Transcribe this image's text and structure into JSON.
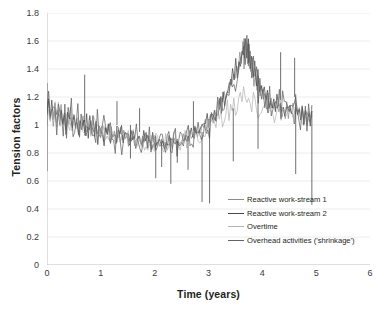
{
  "chart_data": {
    "type": "line",
    "title": "",
    "xlabel": "Time (years)",
    "ylabel": "Tension factors",
    "xlim": [
      0,
      6
    ],
    "ylim": [
      0,
      1.8
    ],
    "xticks": [
      "0",
      "1",
      "2",
      "3",
      "4",
      "5",
      "6"
    ],
    "yticks": [
      "0",
      "0.2",
      "0.4",
      "0.6",
      "0.8",
      "1",
      "1.2",
      "1.4",
      "1.6",
      "1.8"
    ],
    "grid": "horizontal",
    "legend_position": "inside-lower-right",
    "x_data_start": 0.0,
    "x_data_end": 4.92,
    "series": [
      {
        "name": "Reactive work-stream 1",
        "color": "#8c8c8c",
        "values": [
          1.07,
          1.18,
          1.05,
          1.14,
          1.02,
          1.12,
          1.0,
          1.1,
          1.04,
          1.13,
          1.01,
          1.09,
          0.99,
          1.08,
          1.03,
          1.11,
          0.98,
          1.06,
          1.0,
          1.07,
          0.95,
          1.05,
          0.99,
          1.04,
          0.94,
          1.02,
          0.97,
          1.03,
          0.93,
          1.0,
          0.96,
          1.01,
          0.92,
          0.99,
          0.95,
          1.0,
          0.91,
          0.97,
          0.94,
          0.99,
          0.9,
          0.96,
          0.93,
          0.98,
          0.89,
          0.95,
          0.92,
          0.96,
          0.88,
          0.94,
          0.91,
          0.95,
          0.87,
          0.93,
          0.9,
          0.94,
          0.87,
          0.92,
          0.89,
          0.93,
          0.86,
          0.91,
          0.88,
          0.92,
          0.86,
          0.9,
          0.88,
          0.91,
          0.85,
          0.9,
          0.87,
          0.91,
          0.85,
          0.89,
          0.87,
          0.9,
          0.85,
          0.89,
          0.86,
          0.9,
          0.85,
          0.89,
          0.87,
          0.91,
          0.86,
          0.9,
          0.88,
          0.92,
          0.87,
          0.92,
          0.89,
          0.94,
          0.9,
          0.95,
          0.92,
          0.97,
          0.93,
          0.99,
          0.95,
          1.0,
          0.97,
          1.02,
          0.99,
          1.05,
          1.01,
          1.07,
          1.04,
          1.1,
          1.07,
          1.14,
          1.1,
          1.18,
          1.14,
          1.22,
          1.18,
          1.27,
          1.22,
          1.32,
          1.27,
          1.38,
          1.33,
          1.45,
          1.38,
          1.52,
          1.44,
          1.58,
          1.48,
          1.61,
          1.45,
          1.55,
          1.38,
          1.46,
          1.3,
          1.38,
          1.24,
          1.32,
          1.19,
          1.27,
          1.16,
          1.24,
          1.13,
          1.21,
          1.11,
          1.19,
          1.1,
          1.17,
          1.09,
          1.16,
          1.08,
          1.15,
          1.08,
          1.14,
          1.07,
          1.14,
          1.07,
          1.13,
          1.06,
          1.13,
          1.06,
          1.12,
          1.06,
          1.12,
          1.05,
          1.11,
          1.05,
          1.11,
          1.05,
          1.1,
          1.04,
          1.09
        ]
      },
      {
        "name": "Reactive work-stream 2",
        "color": "#4a4a4a",
        "values": [
          1.1,
          1.2,
          1.02,
          1.16,
          0.99,
          1.14,
          1.04,
          1.12,
          0.98,
          1.15,
          1.01,
          1.1,
          0.96,
          1.12,
          1.0,
          1.08,
          0.95,
          1.09,
          0.97,
          1.06,
          0.93,
          1.07,
          0.96,
          1.03,
          0.92,
          1.05,
          0.95,
          1.02,
          0.91,
          1.03,
          0.94,
          1.0,
          0.9,
          1.01,
          0.93,
          0.99,
          0.89,
          0.99,
          0.92,
          0.97,
          0.88,
          0.97,
          0.91,
          0.96,
          0.87,
          0.96,
          0.9,
          0.95,
          0.87,
          0.94,
          0.89,
          0.94,
          0.86,
          0.93,
          0.88,
          0.93,
          0.86,
          0.92,
          0.88,
          0.92,
          0.85,
          0.91,
          0.87,
          0.91,
          0.85,
          0.9,
          0.87,
          0.9,
          0.84,
          0.89,
          0.86,
          0.9,
          0.84,
          0.89,
          0.86,
          0.89,
          0.84,
          0.88,
          0.86,
          0.89,
          0.85,
          0.89,
          0.86,
          0.9,
          0.86,
          0.9,
          0.87,
          0.92,
          0.88,
          0.93,
          0.89,
          0.95,
          0.91,
          0.96,
          0.93,
          0.98,
          0.94,
          1.0,
          0.96,
          1.02,
          0.98,
          1.04,
          1.0,
          1.06,
          1.03,
          1.09,
          1.06,
          1.12,
          1.09,
          1.16,
          1.12,
          1.2,
          1.16,
          1.25,
          1.2,
          1.3,
          1.25,
          1.36,
          1.31,
          1.43,
          1.37,
          1.5,
          1.44,
          1.57,
          1.51,
          1.62,
          1.49,
          1.58,
          1.41,
          1.49,
          1.33,
          1.41,
          1.27,
          1.35,
          1.21,
          1.29,
          1.18,
          1.26,
          1.15,
          1.23,
          1.12,
          1.2,
          1.11,
          1.18,
          1.1,
          1.17,
          1.09,
          1.16,
          1.08,
          1.15,
          1.08,
          1.14,
          1.07,
          1.14,
          1.07,
          1.13,
          1.06,
          1.13,
          1.06,
          1.12,
          1.06,
          1.12,
          1.05,
          1.11,
          1.05,
          1.1,
          1.04,
          1.1
        ]
      },
      {
        "name": "Overtime",
        "color": "#b5b5b5",
        "values": [
          1.05,
          1.15,
          1.08,
          1.11,
          1.06,
          1.1,
          1.03,
          1.09,
          1.05,
          1.08,
          1.02,
          1.07,
          1.04,
          1.06,
          1.01,
          1.05,
          1.02,
          1.04,
          1.0,
          1.03,
          0.99,
          1.02,
          0.99,
          1.01,
          0.97,
          1.0,
          0.98,
          0.99,
          0.96,
          0.98,
          0.96,
          0.97,
          0.95,
          0.97,
          0.94,
          0.96,
          0.93,
          0.95,
          0.93,
          0.95,
          0.92,
          0.94,
          0.92,
          0.94,
          0.91,
          0.93,
          0.91,
          0.93,
          0.9,
          0.92,
          0.9,
          0.92,
          0.89,
          0.91,
          0.89,
          0.91,
          0.88,
          0.9,
          0.89,
          0.9,
          0.88,
          0.9,
          0.88,
          0.89,
          0.87,
          0.89,
          0.88,
          0.89,
          0.87,
          0.88,
          0.87,
          0.89,
          0.87,
          0.88,
          0.87,
          0.88,
          0.87,
          0.88,
          0.88,
          0.89,
          0.88,
          0.89,
          0.89,
          0.9,
          0.89,
          0.91,
          0.9,
          0.92,
          0.91,
          0.93,
          0.92,
          0.94,
          0.93,
          0.95,
          0.94,
          0.96,
          0.95,
          0.98,
          0.96,
          0.99,
          0.98,
          1.01,
          1.0,
          1.03,
          1.02,
          1.05,
          1.04,
          1.07,
          1.06,
          1.09,
          1.08,
          1.11,
          1.1,
          1.13,
          1.12,
          1.15,
          1.14,
          1.17,
          1.16,
          1.19,
          1.17,
          1.21,
          1.19,
          1.22,
          1.18,
          1.21,
          1.16,
          1.19,
          1.14,
          1.17,
          1.12,
          1.15,
          1.11,
          1.14,
          1.1,
          1.13,
          1.09,
          1.12,
          1.09,
          1.12,
          1.08,
          1.11,
          1.08,
          1.11,
          1.08,
          1.1,
          1.07,
          1.1,
          1.07,
          1.09,
          1.07,
          1.09,
          1.06,
          1.09,
          1.06,
          1.08,
          1.06,
          1.08,
          1.05,
          1.08,
          1.05,
          1.07,
          1.05,
          1.07
        ]
      },
      {
        "name": "Overhead activities ('shrinkage')",
        "color": "#636363",
        "values": [
          1.12,
          1.19,
          1.0,
          1.17,
          1.06,
          1.09,
          0.98,
          1.16,
          1.02,
          1.07,
          0.97,
          1.13,
          1.0,
          1.06,
          0.96,
          1.1,
          0.99,
          1.04,
          0.94,
          1.08,
          0.97,
          1.02,
          0.93,
          1.06,
          0.96,
          1.01,
          0.92,
          1.04,
          0.94,
          0.99,
          0.91,
          1.02,
          0.93,
          0.98,
          0.9,
          1.0,
          0.92,
          0.97,
          0.89,
          0.98,
          0.91,
          0.96,
          0.88,
          0.97,
          0.9,
          0.95,
          0.88,
          0.95,
          0.89,
          0.94,
          0.87,
          0.94,
          0.88,
          0.93,
          0.87,
          0.93,
          0.87,
          0.92,
          0.87,
          0.92,
          0.86,
          0.91,
          0.86,
          0.91,
          0.86,
          0.9,
          0.86,
          0.9,
          0.85,
          0.9,
          0.86,
          0.9,
          0.85,
          0.89,
          0.86,
          0.9,
          0.85,
          0.89,
          0.86,
          0.9,
          0.86,
          0.9,
          0.87,
          0.91,
          0.87,
          0.91,
          0.88,
          0.93,
          0.89,
          0.94,
          0.9,
          0.96,
          0.92,
          0.97,
          0.94,
          0.99,
          0.95,
          1.01,
          0.97,
          1.03,
          0.99,
          1.05,
          1.02,
          1.08,
          1.05,
          1.11,
          1.08,
          1.15,
          1.11,
          1.19,
          1.15,
          1.23,
          1.19,
          1.28,
          1.24,
          1.34,
          1.29,
          1.4,
          1.35,
          1.47,
          1.41,
          1.54,
          1.47,
          1.59,
          1.42,
          1.52,
          1.35,
          1.44,
          1.28,
          1.37,
          1.22,
          1.3,
          1.19,
          1.27,
          1.16,
          1.24,
          1.13,
          1.21,
          1.12,
          1.19,
          1.1,
          1.18,
          1.09,
          1.16,
          1.09,
          1.15,
          1.08,
          1.15,
          1.07,
          1.14,
          1.07,
          1.13,
          1.07,
          1.13,
          1.06,
          1.12,
          1.06,
          1.12,
          1.05,
          1.11,
          1.05,
          1.11,
          1.05,
          1.1
        ]
      }
    ],
    "downward_spikes": [
      {
        "x": 0.0,
        "from": 1.3,
        "to": 0.67
      },
      {
        "x": 1.55,
        "from": 1.0,
        "to": 0.76
      },
      {
        "x": 2.02,
        "from": 0.92,
        "to": 0.62
      },
      {
        "x": 2.13,
        "from": 0.9,
        "to": 0.7
      },
      {
        "x": 2.3,
        "from": 0.91,
        "to": 0.58
      },
      {
        "x": 2.42,
        "from": 0.9,
        "to": 0.73
      },
      {
        "x": 2.62,
        "from": 0.92,
        "to": 0.68
      },
      {
        "x": 2.88,
        "from": 0.95,
        "to": 0.45
      },
      {
        "x": 3.02,
        "from": 0.98,
        "to": 0.44
      },
      {
        "x": 3.46,
        "from": 1.12,
        "to": 0.74
      },
      {
        "x": 3.92,
        "from": 1.35,
        "to": 0.83
      },
      {
        "x": 4.62,
        "from": 1.22,
        "to": 0.65
      },
      {
        "x": 4.92,
        "from": 1.1,
        "to": 0.43
      }
    ],
    "upward_spikes": [
      {
        "x": 0.7,
        "from": 1.02,
        "to": 1.36
      },
      {
        "x": 1.3,
        "from": 1.0,
        "to": 1.17
      },
      {
        "x": 1.72,
        "from": 0.95,
        "to": 1.12
      },
      {
        "x": 2.72,
        "from": 0.96,
        "to": 1.17
      },
      {
        "x": 3.66,
        "from": 1.4,
        "to": 1.62
      },
      {
        "x": 3.74,
        "from": 1.42,
        "to": 1.58
      },
      {
        "x": 4.34,
        "from": 1.18,
        "to": 1.52
      },
      {
        "x": 4.6,
        "from": 1.2,
        "to": 1.48
      }
    ]
  }
}
